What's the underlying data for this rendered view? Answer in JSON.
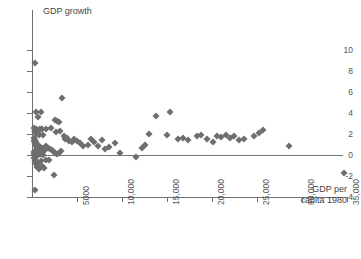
{
  "chart_data": {
    "type": "scatter",
    "title": "",
    "ylabel": "GDP growth",
    "xlabel": "GDP per capita 1980",
    "xlabel_line1": "GDP per",
    "xlabel_line2": "capita 1980",
    "xlim": [
      0,
      35500
    ],
    "ylim": [
      -4,
      10
    ],
    "grid": false,
    "legend": null,
    "marker": "diamond",
    "marker_color": "#6e6e6e",
    "zero_line": 0,
    "xticks": [
      5000,
      10000,
      15000,
      20000,
      25000,
      30000,
      35000
    ],
    "xtick_labels": [
      "5000",
      "10,000",
      "15,000",
      "20,000",
      "25,000",
      "30,000",
      "35,000"
    ],
    "yticks": [
      -4,
      -2,
      0,
      2,
      4,
      6,
      8,
      10
    ],
    "ytick_labels": [
      "-4",
      "-2",
      "0",
      "2",
      "4",
      "6",
      "8",
      "10"
    ],
    "points": [
      [
        330,
        8.8
      ],
      [
        400,
        4.1
      ],
      [
        1050,
        4.1
      ],
      [
        700,
        3.6
      ],
      [
        3350,
        5.4
      ],
      [
        2600,
        3.3
      ],
      [
        2800,
        3.2
      ],
      [
        2950,
        3.1
      ],
      [
        250,
        2.6
      ],
      [
        300,
        2.4
      ],
      [
        330,
        2.2
      ],
      [
        360,
        2.3
      ],
      [
        420,
        2.1
      ],
      [
        450,
        2.5
      ],
      [
        500,
        2.2
      ],
      [
        560,
        2.0
      ],
      [
        640,
        2.4
      ],
      [
        700,
        2.1
      ],
      [
        780,
        1.9
      ],
      [
        900,
        2.5
      ],
      [
        1100,
        2.5
      ],
      [
        1250,
        1.9
      ],
      [
        1500,
        2.5
      ],
      [
        2100,
        2.6
      ],
      [
        2700,
        2.2
      ],
      [
        3100,
        2.3
      ],
      [
        3500,
        1.8
      ],
      [
        3650,
        1.5
      ],
      [
        3900,
        1.6
      ],
      [
        4100,
        1.3
      ],
      [
        4400,
        1.2
      ],
      [
        4700,
        1.5
      ],
      [
        5000,
        1.3
      ],
      [
        5300,
        1.1
      ],
      [
        5700,
        0.9
      ],
      [
        200,
        1.6
      ],
      [
        260,
        1.3
      ],
      [
        320,
        1.1
      ],
      [
        380,
        1.4
      ],
      [
        430,
        0.9
      ],
      [
        480,
        1.2
      ],
      [
        530,
        0.8
      ],
      [
        600,
        1.0
      ],
      [
        680,
        0.7
      ],
      [
        750,
        0.9
      ],
      [
        820,
        0.6
      ],
      [
        900,
        0.8
      ],
      [
        1000,
        0.5
      ],
      [
        1150,
        0.7
      ],
      [
        1300,
        0.4
      ],
      [
        1450,
        0.6
      ],
      [
        1600,
        0.9
      ],
      [
        1800,
        0.7
      ],
      [
        2000,
        0.6
      ],
      [
        2250,
        0.5
      ],
      [
        2450,
        0.3
      ],
      [
        2600,
        0.2
      ],
      [
        2800,
        0.1
      ],
      [
        3000,
        0.2
      ],
      [
        3200,
        0.4
      ],
      [
        200,
        0.3
      ],
      [
        250,
        0.1
      ],
      [
        300,
        0.4
      ],
      [
        350,
        0.2
      ],
      [
        400,
        0.0
      ],
      [
        450,
        0.3
      ],
      [
        500,
        0.1
      ],
      [
        560,
        0.5
      ],
      [
        620,
        0.2
      ],
      [
        700,
        0.0
      ],
      [
        800,
        0.3
      ],
      [
        880,
        0.1
      ],
      [
        980,
        0.4
      ],
      [
        1100,
        0.2
      ],
      [
        1250,
        0.0
      ],
      [
        250,
        -0.3
      ],
      [
        320,
        -0.6
      ],
      [
        380,
        -0.4
      ],
      [
        450,
        -0.9
      ],
      [
        520,
        -0.7
      ],
      [
        600,
        -1.1
      ],
      [
        700,
        -0.8
      ],
      [
        820,
        -1.3
      ],
      [
        950,
        -0.6
      ],
      [
        1100,
        -1.0
      ],
      [
        1300,
        -1.2
      ],
      [
        1500,
        -0.5
      ],
      [
        1900,
        -0.5
      ],
      [
        2400,
        -1.9
      ],
      [
        300,
        -3.3
      ],
      [
        6200,
        1.0
      ],
      [
        6500,
        1.5
      ],
      [
        6900,
        1.2
      ],
      [
        7300,
        0.9
      ],
      [
        7800,
        1.4
      ],
      [
        8100,
        0.6
      ],
      [
        8600,
        0.8
      ],
      [
        9200,
        1.1
      ],
      [
        9800,
        0.2
      ],
      [
        11500,
        -0.15
      ],
      [
        12200,
        0.7
      ],
      [
        12600,
        1.0
      ],
      [
        13800,
        3.7
      ],
      [
        15300,
        4.1
      ],
      [
        13000,
        2.0
      ],
      [
        15000,
        1.9
      ],
      [
        16200,
        1.5
      ],
      [
        16800,
        1.6
      ],
      [
        17300,
        1.4
      ],
      [
        18300,
        1.8
      ],
      [
        18800,
        1.9
      ],
      [
        19400,
        1.5
      ],
      [
        20100,
        1.2
      ],
      [
        20600,
        1.8
      ],
      [
        21000,
        1.7
      ],
      [
        21500,
        1.9
      ],
      [
        22000,
        1.6
      ],
      [
        22400,
        1.8
      ],
      [
        23000,
        1.4
      ],
      [
        23600,
        1.5
      ],
      [
        24700,
        1.8
      ],
      [
        25200,
        2.1
      ],
      [
        25700,
        2.4
      ],
      [
        28500,
        0.9
      ],
      [
        34700,
        -1.7
      ]
    ]
  }
}
